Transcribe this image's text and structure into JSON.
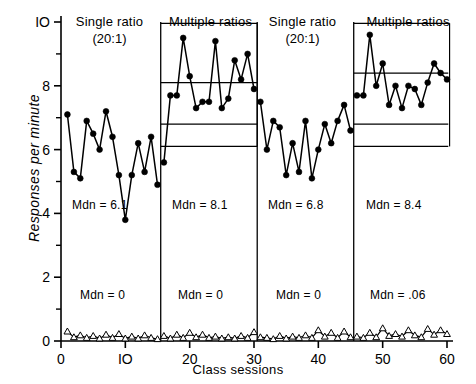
{
  "figure": {
    "ylabel": "Responses per minute",
    "xlabel": "Class sessions"
  },
  "panels": [
    {
      "title": "Single ratio",
      "subtitle": "(20:1)",
      "mdn_top": "Mdn = 6.1",
      "mdn_bottom": "Mdn = 0"
    },
    {
      "title": "Multiple ratios",
      "subtitle": "",
      "mdn_top": "Mdn = 8.1",
      "mdn_bottom": "Mdn = 0"
    },
    {
      "title": "Single ratio",
      "subtitle": "(20:1)",
      "mdn_top": "Mdn = 6.8",
      "mdn_bottom": "Mdn = 0"
    },
    {
      "title": "Multiple ratios",
      "subtitle": "",
      "mdn_top": "Mdn = 8.4",
      "mdn_bottom": "Mdn = .06"
    }
  ],
  "chart_data": {
    "type": "line",
    "title": "",
    "xlabel": "Class sessions",
    "ylabel": "Responses per minute",
    "xlim": [
      0,
      60
    ],
    "ylim": [
      0,
      10
    ],
    "xticks": [
      0,
      10,
      20,
      30,
      40,
      50,
      60
    ],
    "yticks": [
      0,
      2,
      4,
      6,
      8,
      10
    ],
    "yminorticks": [
      1,
      3,
      5,
      7,
      9
    ],
    "grid": false,
    "legend_position": "none",
    "phases": [
      {
        "label": "Single ratio (20:1)",
        "x_start": 1,
        "x_end": 15,
        "median_upper": 6.1,
        "median_lower": 0
      },
      {
        "label": "Multiple ratios",
        "x_start": 16,
        "x_end": 30,
        "median_upper": 8.1,
        "median_lower": 0
      },
      {
        "label": "Single ratio (20:1)",
        "x_start": 31,
        "x_end": 45,
        "median_upper": 6.8,
        "median_lower": 0
      },
      {
        "label": "Multiple ratios",
        "x_start": 46,
        "x_end": 60,
        "median_upper": 8.4,
        "median_lower": 0.06
      }
    ],
    "phase_boundaries": [
      15.5,
      30.5,
      45.5
    ],
    "reference_lines": [
      {
        "panel": 2,
        "value": 8.1,
        "x_start": 15.5,
        "x_end": 30.5
      },
      {
        "panel": 2,
        "value": 6.8,
        "x_start": 15.5,
        "x_end": 30.5
      },
      {
        "panel": 2,
        "value": 6.1,
        "x_start": 15.5,
        "x_end": 30.5
      },
      {
        "panel": 4,
        "value": 8.4,
        "x_start": 45.5,
        "x_end": 60.5
      },
      {
        "panel": 4,
        "value": 6.8,
        "x_start": 45.5,
        "x_end": 60.5
      },
      {
        "panel": 4,
        "value": 6.1,
        "x_start": 45.5,
        "x_end": 60.5
      }
    ],
    "series": [
      {
        "name": "Responses per minute (filled circles)",
        "marker": "filled-circle",
        "x": [
          1,
          2,
          3,
          4,
          5,
          6,
          7,
          8,
          9,
          10,
          11,
          12,
          13,
          14,
          15,
          16,
          17,
          18,
          19,
          20,
          21,
          22,
          23,
          24,
          25,
          26,
          27,
          28,
          29,
          30,
          31,
          32,
          33,
          34,
          35,
          36,
          37,
          38,
          39,
          40,
          41,
          42,
          43,
          44,
          45,
          46,
          47,
          48,
          49,
          50,
          51,
          52,
          53,
          54,
          55,
          56,
          57,
          58,
          59,
          60
        ],
        "values": [
          7.1,
          5.3,
          5.1,
          6.9,
          6.5,
          6.0,
          7.2,
          6.4,
          5.2,
          3.8,
          5.2,
          6.2,
          5.3,
          6.4,
          4.9,
          5.6,
          7.7,
          7.7,
          9.5,
          8.3,
          7.3,
          7.5,
          7.5,
          9.4,
          7.3,
          7.6,
          8.8,
          8.2,
          9.0,
          7.9,
          7.5,
          6.0,
          6.9,
          6.7,
          5.2,
          6.2,
          5.3,
          6.9,
          5.1,
          6.0,
          6.8,
          6.2,
          6.9,
          7.4,
          6.6,
          7.7,
          7.7,
          9.6,
          8.0,
          8.7,
          7.4,
          8.0,
          7.3,
          8.0,
          7.9,
          7.4,
          8.1,
          8.7,
          8.4,
          8.2
        ]
      },
      {
        "name": "Disruptions per minute (open triangles)",
        "marker": "open-triangle",
        "x": [
          1,
          2,
          3,
          4,
          5,
          6,
          7,
          8,
          9,
          10,
          11,
          12,
          13,
          14,
          15,
          16,
          17,
          18,
          19,
          20,
          21,
          22,
          23,
          24,
          25,
          26,
          27,
          28,
          29,
          30,
          31,
          32,
          33,
          34,
          35,
          36,
          37,
          38,
          39,
          40,
          41,
          42,
          43,
          44,
          45,
          46,
          47,
          48,
          49,
          50,
          51,
          52,
          53,
          54,
          55,
          56,
          57,
          58,
          59,
          60
        ],
        "values": [
          0.3,
          0.12,
          0.18,
          0.1,
          0.16,
          0.08,
          0.2,
          0.1,
          0.22,
          0.08,
          0.14,
          0.08,
          0.18,
          0.1,
          0.06,
          0.16,
          0.08,
          0.2,
          0.1,
          0.26,
          0.12,
          0.2,
          0.1,
          0.14,
          0.08,
          0.12,
          0.08,
          0.16,
          0.1,
          0.28,
          0.12,
          0.1,
          0.06,
          0.16,
          0.08,
          0.14,
          0.1,
          0.18,
          0.1,
          0.34,
          0.14,
          0.26,
          0.1,
          0.3,
          0.12,
          0.14,
          0.1,
          0.26,
          0.12,
          0.4,
          0.16,
          0.22,
          0.14,
          0.34,
          0.18,
          0.12,
          0.38,
          0.2,
          0.34,
          0.22
        ]
      }
    ]
  }
}
